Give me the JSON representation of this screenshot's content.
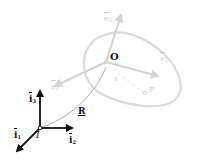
{
  "diagram": {
    "type": "rigid-body-kinematics",
    "colors": {
      "inertial_frame": "#111111",
      "body_frame": "#d4d4d4",
      "body_outline": "#dcdcdc",
      "position_curve": "#9a9a9a",
      "background": "#ffffff"
    },
    "inertial_frame": {
      "origin_label": "I",
      "axes": [
        {
          "name": "i1",
          "base": "i",
          "sub": "1"
        },
        {
          "name": "i2",
          "base": "i",
          "sub": "2"
        },
        {
          "name": "i3",
          "base": "i",
          "sub": "3"
        }
      ]
    },
    "body": {
      "origin_label": "O",
      "point_label": "P",
      "relative_position_label": "x",
      "axes": [
        {
          "name": "e1",
          "base": "e",
          "sub": "1"
        },
        {
          "name": "e2",
          "base": "e",
          "sub": "2"
        },
        {
          "name": "e3",
          "base": "e",
          "sub": "3"
        }
      ]
    },
    "position_vector": {
      "label": "R"
    }
  }
}
